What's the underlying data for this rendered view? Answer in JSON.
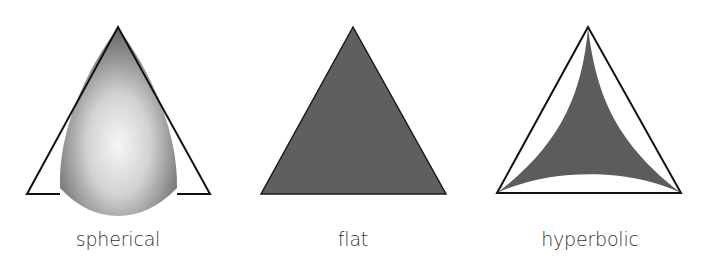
{
  "diagram": {
    "panels": [
      {
        "id": "spherical",
        "label": "spherical",
        "description": "Triangle with outward-bulging sides (positive curvature) drawn over a flat reference triangle outline",
        "fill_style": "radial-gradient",
        "colors": {
          "center": "#f4f4f4",
          "edge": "#6e6e6e",
          "outline": "#111111"
        }
      },
      {
        "id": "flat",
        "label": "flat",
        "description": "Euclidean triangle with straight sides",
        "fill_style": "solid",
        "colors": {
          "fill": "#5f5f5f",
          "outline": "#1a1a1a"
        }
      },
      {
        "id": "hyperbolic",
        "label": "hyperbolic",
        "description": "Triangle with inward-curving sides (negative curvature) inside a flat reference triangle outline",
        "fill_style": "solid",
        "colors": {
          "fill": "#5c5c5c",
          "outline": "#111111"
        }
      }
    ]
  }
}
